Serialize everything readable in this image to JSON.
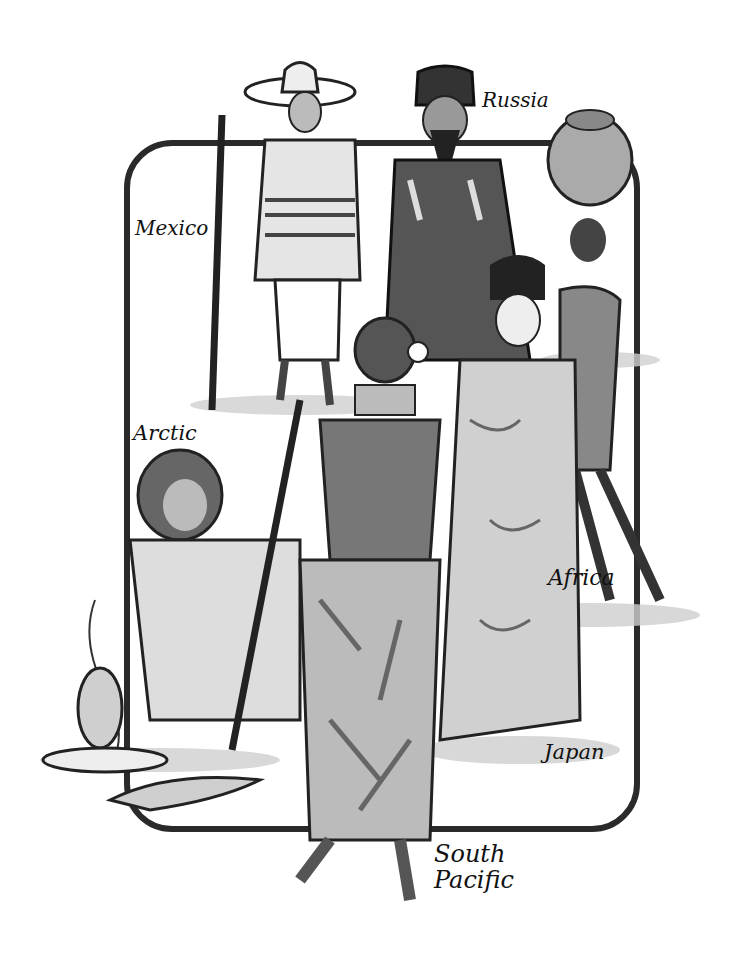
{
  "illustration": {
    "description": "Black and white ink illustration of people in traditional dress from around the world",
    "labels": [
      {
        "id": "mexico",
        "text": "Mexico"
      },
      {
        "id": "russia",
        "text": "Russia"
      },
      {
        "id": "arctic",
        "text": "Arctic"
      },
      {
        "id": "africa",
        "text": "Africa"
      },
      {
        "id": "japan",
        "text": "Japan"
      },
      {
        "id": "south_pacific_line1",
        "text": "South"
      },
      {
        "id": "south_pacific_line2",
        "text": "Pacific"
      }
    ]
  }
}
